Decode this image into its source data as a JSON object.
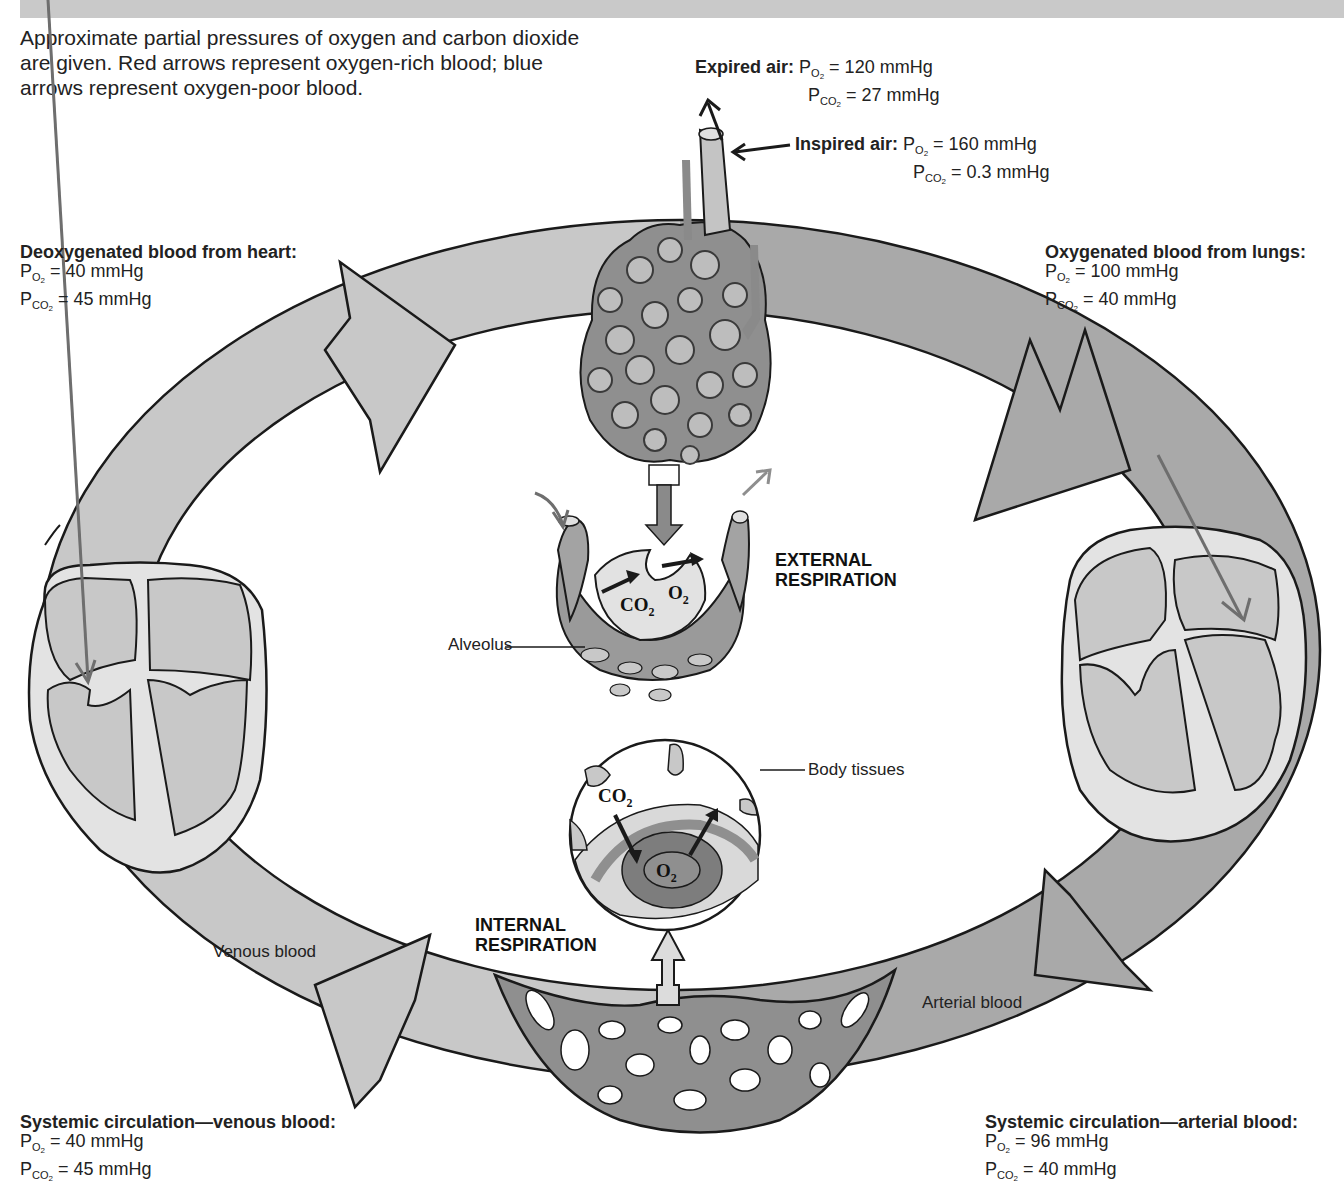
{
  "header": {
    "title_cropped": ""
  },
  "intro": {
    "line1": "Approximate partial pressures of oxygen and carbon dioxide",
    "line2": "are given. Red arrows represent oxygen-rich blood; blue",
    "line3": "arrows represent oxygen-poor blood."
  },
  "expired_air": {
    "title": "Expired air:",
    "po2": "= 120 mmHg",
    "pco2": "= 27 mmHg"
  },
  "inspired_air": {
    "title": "Inspired air:",
    "po2": "= 160 mmHg",
    "pco2": "= 0.3 mmHg"
  },
  "deoxygenated": {
    "title": "Deoxygenated blood from heart:",
    "po2": "= 40 mmHg",
    "pco2": "= 45 mmHg"
  },
  "oxygenated": {
    "title": "Oxygenated blood from lungs:",
    "po2": "= 100 mmHg",
    "pco2": "= 40 mmHg"
  },
  "systemic_venous": {
    "title": "Systemic circulation—venous blood:",
    "po2": "= 40 mmHg",
    "pco2": "= 45 mmHg"
  },
  "systemic_arterial": {
    "title": "Systemic circulation—arterial blood:",
    "po2": "= 96 mmHg",
    "pco2": "= 40 mmHg"
  },
  "labels": {
    "p": "P",
    "o2": "O",
    "co2": "CO",
    "two": "2",
    "external_1": "EXTERNAL",
    "external_2": "RESPIRATION",
    "internal_1": "INTERNAL",
    "internal_2": "RESPIRATION",
    "alveolus": "Alveolus",
    "body_tissues": "Body tissues",
    "venous_blood": "Venous blood",
    "arterial_blood": "Arterial blood",
    "alv_co2": "CO",
    "alv_o2": "O",
    "tis_co2": "CO",
    "tis_o2": "O"
  },
  "colors": {
    "ring_venous": "#c8c8c8",
    "ring_arterial": "#a9a9a9",
    "vessel": "#8a8a8a",
    "outline": "#1a1a1a",
    "header": "#c9c9c9"
  }
}
